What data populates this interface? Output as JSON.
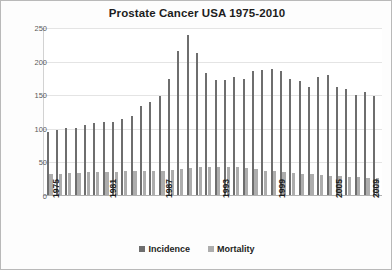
{
  "chart_data": {
    "type": "bar",
    "title": "Prostate Cancer USA 1975-2010",
    "xlabel": "",
    "ylabel": "Age Adjusted Rate per 100,000",
    "ylim": [
      0,
      250
    ],
    "yticks": [
      0,
      50,
      100,
      150,
      200,
      250
    ],
    "xtick_labels": [
      "1975",
      "1981",
      "1987",
      "1993",
      "1999",
      "2005",
      "2009"
    ],
    "grid": true,
    "legend_position": "bottom",
    "categories": [
      "1975",
      "1976",
      "1977",
      "1978",
      "1979",
      "1980",
      "1981",
      "1982",
      "1983",
      "1984",
      "1985",
      "1986",
      "1987",
      "1988",
      "1989",
      "1990",
      "1991",
      "1992",
      "1993",
      "1994",
      "1995",
      "1996",
      "1997",
      "1998",
      "1999",
      "2000",
      "2001",
      "2002",
      "2003",
      "2004",
      "2005",
      "2006",
      "2007",
      "2008",
      "2009",
      "2010"
    ],
    "series": [
      {
        "name": "Incidence",
        "color": "#6e6e6e",
        "values": [
          94,
          97,
          100,
          100,
          104,
          107,
          108,
          108,
          113,
          117,
          133,
          138,
          147,
          172,
          215,
          238,
          212,
          182,
          171,
          171,
          175,
          173,
          185,
          186,
          188,
          185,
          172,
          169,
          160,
          175,
          178,
          161,
          158,
          149,
          154,
          147
        ]
      },
      {
        "name": "Mortality",
        "color": "#adadad",
        "values": [
          31,
          32,
          33,
          33,
          34,
          34,
          34,
          34,
          35,
          35,
          35,
          36,
          36,
          37,
          38,
          40,
          41,
          41,
          42,
          42,
          41,
          40,
          38,
          36,
          35,
          34,
          33,
          32,
          31,
          30,
          28,
          28,
          27,
          27,
          26,
          26
        ]
      }
    ]
  },
  "legend": {
    "items": [
      {
        "label": "Incidence",
        "color": "#6e6e6e"
      },
      {
        "label": "Mortality",
        "color": "#adadad"
      }
    ]
  }
}
